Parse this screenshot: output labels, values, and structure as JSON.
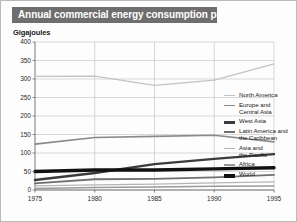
{
  "title": "Annual commercial energy consumption per capita",
  "axis_unit_label": "Gigajoules",
  "colors": {
    "banner_bg": "#6e6e6e",
    "banner_text": "#ffffff",
    "grid": "#c7c7c7",
    "axis": "#6a6a6a",
    "page_bg": "#fdfdfd",
    "frame": "#b9b9b9"
  },
  "legend": {
    "position": "right",
    "items": [
      {
        "label": "North America",
        "color": "#c3c3c3",
        "width": 1.2,
        "swatch_name": "legend-swatch-north-america"
      },
      {
        "label": "Europe and\nCentral Asia",
        "color": "#8a8a8a",
        "width": 1.6,
        "swatch_name": "legend-swatch-europe-central-asia"
      },
      {
        "label": "West Asia",
        "color": "#3b3b3b",
        "width": 2.4,
        "swatch_name": "legend-swatch-west-asia"
      },
      {
        "label": "Latin America and\nthe Caribbean",
        "color": "#707070",
        "width": 1.8,
        "swatch_name": "legend-swatch-latin-america"
      },
      {
        "label": "Asia and\nthe Pacific",
        "color": "#b5b5b5",
        "width": 1.3,
        "swatch_name": "legend-swatch-asia-pacific"
      },
      {
        "label": "Africa",
        "color": "#9a9a9a",
        "width": 1.5,
        "swatch_name": "legend-swatch-africa"
      },
      {
        "label": "World",
        "color": "#111111",
        "width": 3.4,
        "swatch_name": "legend-swatch-world"
      }
    ]
  },
  "chart_data": {
    "type": "line",
    "title": "Annual commercial energy consumption per capita",
    "xlabel": "",
    "ylabel": "Gigajoules",
    "x": [
      1975,
      1980,
      1985,
      1990,
      1995
    ],
    "xticks": [
      "1975",
      "1980",
      "1985",
      "1990",
      "1995"
    ],
    "yticks": [
      0,
      50,
      100,
      150,
      200,
      250,
      300,
      350,
      400
    ],
    "ytick_labels": [
      "0",
      "50",
      "100",
      "150",
      "200",
      "250",
      "300",
      "350",
      "400"
    ],
    "ylim": [
      0,
      400
    ],
    "xlim": [
      1975,
      1995
    ],
    "grid": true,
    "legend_position": "right",
    "series": [
      {
        "name": "North America",
        "values": [
          307,
          308,
          283,
          297,
          341
        ],
        "color": "#c3c3c3",
        "width": 1.2
      },
      {
        "name": "Europe and Central Asia",
        "values": [
          124,
          142,
          145,
          148,
          130
        ],
        "color": "#8a8a8a",
        "width": 1.6
      },
      {
        "name": "West Asia",
        "values": [
          27,
          46,
          70,
          84,
          97
        ],
        "color": "#3b3b3b",
        "width": 2.4
      },
      {
        "name": "Latin America and the Caribbean",
        "values": [
          18,
          29,
          30,
          34,
          41
        ],
        "color": "#707070",
        "width": 1.8
      },
      {
        "name": "Asia and the Pacific",
        "values": [
          11,
          14,
          16,
          19,
          22
        ],
        "color": "#b5b5b5",
        "width": 1.3
      },
      {
        "name": "Africa",
        "values": [
          4,
          7,
          8,
          10,
          11
        ],
        "color": "#9a9a9a",
        "width": 1.5
      },
      {
        "name": "World",
        "values": [
          50,
          54,
          54,
          57,
          60
        ],
        "color": "#111111",
        "width": 3.4
      }
    ]
  }
}
